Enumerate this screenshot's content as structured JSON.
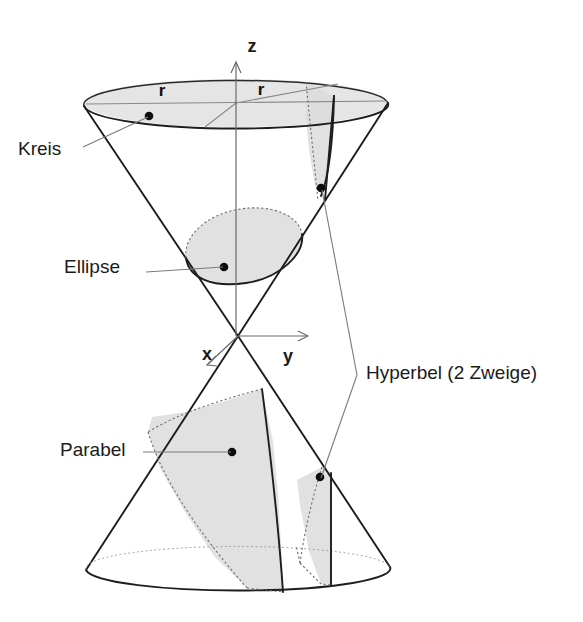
{
  "figure": {
    "background_color": "#ffffff",
    "ink_color": "#1a1a1a",
    "section_fill_color": "#dcdcdc",
    "hidden_edge_color": "#6e6e6e"
  },
  "labels": {
    "kreis": "Kreis",
    "ellipse": "Ellipse",
    "parabel": "Parabel",
    "hyperbel": "Hyperbel (2 Zweige)"
  },
  "axes": {
    "z": "z",
    "y": "y",
    "x": "x"
  },
  "radius": {
    "left": "r",
    "right": "r"
  },
  "geometry": {
    "apex": {
      "x": 238,
      "y": 336
    },
    "top_ellipse": {
      "center_x": 236,
      "center_y": 103,
      "rx": 152,
      "ry": 24
    },
    "bottom_ellipse": {
      "center_x": 238,
      "center_y": 568,
      "rx": 152,
      "ry": 22
    }
  }
}
